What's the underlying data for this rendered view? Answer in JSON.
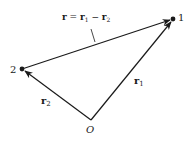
{
  "diagram": {
    "type": "vector-diagram",
    "colors": {
      "stroke": "#1a1a1a",
      "background": "#ffffff"
    },
    "points": [
      {
        "id": "1",
        "label": "1",
        "x": 173,
        "y": 19
      },
      {
        "id": "2",
        "label": "2",
        "x": 22,
        "y": 69
      },
      {
        "id": "O",
        "label": "O",
        "x": 91,
        "y": 120
      }
    ],
    "vectors": [
      {
        "name": "r1",
        "from": "O",
        "to": "1",
        "label_main": "r",
        "label_sub": "1"
      },
      {
        "name": "r2",
        "from": "O",
        "to": "2",
        "label_main": "r",
        "label_sub": "2"
      },
      {
        "name": "r",
        "from": "2",
        "to": "1",
        "label": "r = r1 − r2"
      }
    ],
    "relation_label": {
      "r": "r",
      "eq": " = ",
      "r1": "r",
      "r1_sub": "1",
      "minus": " − ",
      "r2": "r",
      "r2_sub": "2"
    },
    "labels": {
      "point1": "1",
      "point2": "2",
      "origin": "O",
      "r1_main": "r",
      "r1_sub": "1",
      "r2_main": "r",
      "r2_sub": "2"
    }
  }
}
